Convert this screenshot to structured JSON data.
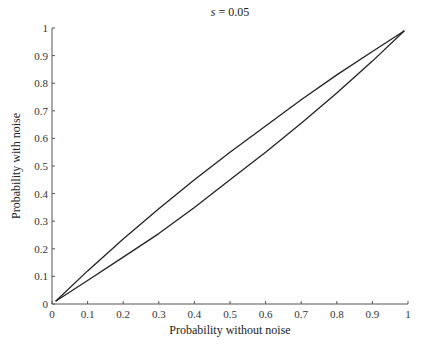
{
  "chart_data": {
    "type": "line",
    "title": "s = 0.05",
    "title_var": "s",
    "title_rest": " = 0.05",
    "xlabel": "Probability without noise",
    "ylabel": "Probability with noise",
    "xlim": [
      0,
      1
    ],
    "ylim": [
      0,
      1
    ],
    "grid": false,
    "legend": null,
    "xticks": [
      "0",
      "0.1",
      "0.2",
      "0.3",
      "0.4",
      "0.5",
      "0.6",
      "0.7",
      "0.8",
      "0.9",
      "1"
    ],
    "yticks": [
      "0",
      "0.1",
      "0.2",
      "0.3",
      "0.4",
      "0.5",
      "0.6",
      "0.7",
      "0.8",
      "0.9",
      "1"
    ],
    "series": [
      {
        "name": "upper curve",
        "x": [
          0.01,
          0.1,
          0.2,
          0.3,
          0.4,
          0.5,
          0.6,
          0.7,
          0.8,
          0.9,
          0.99
        ],
        "y": [
          0.01,
          0.12,
          0.235,
          0.345,
          0.45,
          0.55,
          0.645,
          0.74,
          0.83,
          0.915,
          0.99
        ]
      },
      {
        "name": "lower curve",
        "x": [
          0.01,
          0.1,
          0.2,
          0.3,
          0.4,
          0.5,
          0.6,
          0.7,
          0.8,
          0.9,
          0.99
        ],
        "y": [
          0.01,
          0.085,
          0.17,
          0.255,
          0.35,
          0.45,
          0.55,
          0.655,
          0.765,
          0.88,
          0.99
        ]
      }
    ],
    "line_color": "#222222"
  }
}
